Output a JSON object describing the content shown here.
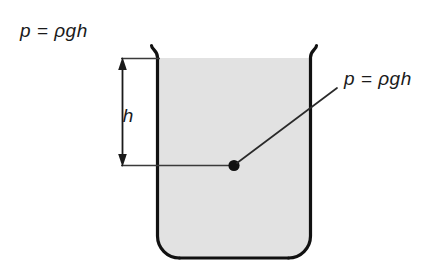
{
  "figure": {
    "background_color": "#ffffff",
    "stroke_color": "#1a1a1a",
    "liquid_color": "#e2e2e2"
  },
  "labels": {
    "top_left_formula": "p = ρgh",
    "callout_formula": "p = ρgh",
    "depth_label": "h"
  },
  "annotations": {
    "dimension_name": "depth-dimension",
    "point_name": "pressure-point",
    "leader_name": "callout-leader-line"
  },
  "geometry": {
    "container_left_x": 157,
    "container_right_x": 311,
    "container_top_y": 45,
    "container_bottom_y": 258,
    "liquid_surface_y": 58,
    "point_x": 234,
    "point_y": 165,
    "dimension_x": 122
  }
}
